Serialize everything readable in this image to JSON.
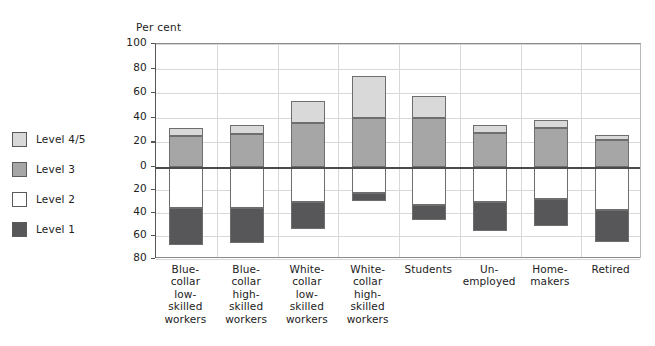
{
  "chart_data": {
    "type": "bar",
    "subtype": "diverging-stacked-bar",
    "title": "",
    "ylabel": "Per cent",
    "xlabel": "",
    "grid": true,
    "legend_position": "left",
    "y_axis": {
      "positive_ticks": [
        0,
        20,
        40,
        60,
        80,
        100
      ],
      "negative_ticks": [
        20,
        40,
        60,
        80
      ],
      "tick_labels_top_to_bottom": [
        "100",
        "80",
        "60",
        "40",
        "20",
        "0",
        "20",
        "40",
        "60",
        "80"
      ],
      "ylim_positive": [
        0,
        100
      ],
      "ylim_negative": [
        0,
        80
      ],
      "note": "Values below the zero line are plotted downward as positive magnitudes"
    },
    "categories": [
      "Blue-collar low-skilled workers",
      "Blue-collar high-skilled workers",
      "White-collar low-skilled workers",
      "White-collar high-skilled workers",
      "Students",
      "Un-employed",
      "Home-makers",
      "Retired"
    ],
    "category_lines": [
      [
        "Blue-",
        "collar",
        "low-",
        "skilled",
        "workers"
      ],
      [
        "Blue-",
        "collar",
        "high-",
        "skilled",
        "workers"
      ],
      [
        "White-",
        "collar",
        "low-",
        "skilled",
        "workers"
      ],
      [
        "White-",
        "collar",
        "high-",
        "skilled",
        "workers"
      ],
      [
        "Students"
      ],
      [
        "Un-",
        "employed"
      ],
      [
        "Home-",
        "makers"
      ],
      [
        "Retired"
      ]
    ],
    "series": [
      {
        "name": "Level 4/5",
        "direction": "up",
        "color": "#d9d9d9",
        "values": [
          7,
          7,
          18,
          34,
          18,
          6,
          6,
          4
        ]
      },
      {
        "name": "Level 3",
        "direction": "up",
        "color": "#a6a6a6",
        "values": [
          25,
          27,
          36,
          40,
          40,
          28,
          32,
          22
        ]
      },
      {
        "name": "Level 2",
        "direction": "down",
        "color": "#ffffff",
        "values": [
          36,
          36,
          30,
          23,
          33,
          30,
          28,
          37
        ]
      },
      {
        "name": "Level 1",
        "direction": "down",
        "color": "#57575a",
        "values": [
          32,
          30,
          24,
          7,
          13,
          26,
          23,
          28
        ]
      }
    ],
    "totals_up": [
      32,
      34,
      54,
      74,
      58,
      34,
      38,
      26
    ],
    "totals_down": [
      68,
      66,
      54,
      30,
      46,
      56,
      51,
      65
    ]
  },
  "legend": {
    "items": [
      {
        "label": "Level 4/5",
        "color": "#d9d9d9"
      },
      {
        "label": "Level 3",
        "color": "#a6a6a6"
      },
      {
        "label": "Level 2",
        "color": "#ffffff"
      },
      {
        "label": "Level 1",
        "color": "#57575a"
      }
    ]
  },
  "axis": {
    "unit_label": "Per cent"
  }
}
